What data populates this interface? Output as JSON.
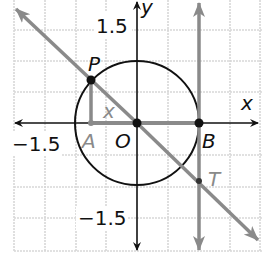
{
  "diagram": {
    "axes": {
      "x_label": "x",
      "y_label": "y"
    },
    "ticks": {
      "y_pos": "1.5",
      "y_neg": "−1.5",
      "x_neg": "−1.5"
    },
    "points": {
      "P": "P",
      "A": "A",
      "O": "O",
      "B": "B",
      "T": "T"
    },
    "angle_label": "x",
    "colors": {
      "grid": "#d8d8d8",
      "axis": "#111111",
      "circle": "#111111",
      "gray_line": "#8a8a8a",
      "label_dark": "#111111",
      "label_gray": "#8a8a8a"
    }
  }
}
